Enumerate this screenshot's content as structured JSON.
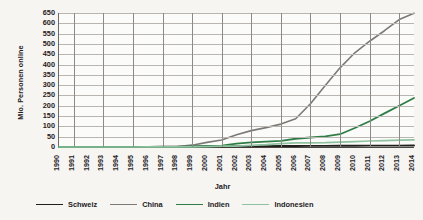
{
  "chart_data": {
    "type": "line",
    "title": "",
    "xlabel": "Jahr",
    "ylabel": "Mio. Personen online",
    "xlim": [
      1990,
      2014
    ],
    "ylim": [
      0,
      650
    ],
    "ytick_step": 50,
    "grid": true,
    "legend_position": "bottom",
    "categories": [
      1990,
      1991,
      1992,
      1993,
      1994,
      1995,
      1996,
      1997,
      1998,
      1999,
      2000,
      2001,
      2002,
      2003,
      2004,
      2005,
      2006,
      2007,
      2008,
      2009,
      2010,
      2011,
      2012,
      2013,
      2014
    ],
    "yticks": [
      0,
      50,
      100,
      150,
      200,
      250,
      300,
      350,
      400,
      450,
      500,
      550,
      600,
      650
    ],
    "xticks": [
      "1990",
      "1991",
      "1992",
      "1993",
      "1994",
      "1995",
      "1996",
      "1997",
      "1998",
      "1999",
      "2000",
      "2001",
      "2002",
      "2003",
      "2004",
      "2005",
      "2006",
      "2007",
      "2008",
      "2009",
      "2010",
      "2011",
      "2012",
      "2013",
      "2014"
    ],
    "series": [
      {
        "name": "Schweiz",
        "color": "#231f1c",
        "width": 1.9,
        "values": [
          0,
          0,
          0,
          0.1,
          0.2,
          0.4,
          0.7,
          1.1,
          1.5,
          2.0,
          2.5,
          3.0,
          3.4,
          3.8,
          4.2,
          4.6,
          5.0,
          5.3,
          5.6,
          5.9,
          6.2,
          6.5,
          6.7,
          6.9,
          7.1
        ]
      },
      {
        "name": "China",
        "color": "#7c7a76",
        "width": 1.6,
        "values": [
          0,
          0,
          0,
          0,
          0.1,
          0.2,
          0.5,
          1.0,
          2.1,
          8.9,
          22.5,
          33.7,
          59.1,
          79.5,
          94.0,
          111.0,
          137.0,
          210.0,
          298.0,
          384.0,
          457.0,
          513.0,
          564.0,
          618.0,
          649.0
        ]
      },
      {
        "name": "Indien",
        "color": "#2e7d46",
        "width": 1.8,
        "values": [
          0,
          0,
          0,
          0,
          0.1,
          0.2,
          0.3,
          0.5,
          1.0,
          2.8,
          5.5,
          7.0,
          16.5,
          22.0,
          26.0,
          30.0,
          40.0,
          46.0,
          52.0,
          62.0,
          92.0,
          125.0,
          163.0,
          200.0,
          238.0
        ]
      },
      {
        "name": "Indonesien",
        "color": "#8fc3a0",
        "width": 1.7,
        "values": [
          0,
          0,
          0,
          0,
          0,
          0.1,
          0.2,
          0.3,
          0.5,
          0.9,
          2.0,
          4.0,
          4.5,
          8.0,
          11.2,
          16.0,
          20.0,
          20.0,
          21.0,
          24.0,
          26.0,
          29.0,
          31.0,
          33.0,
          35.0
        ]
      }
    ]
  }
}
